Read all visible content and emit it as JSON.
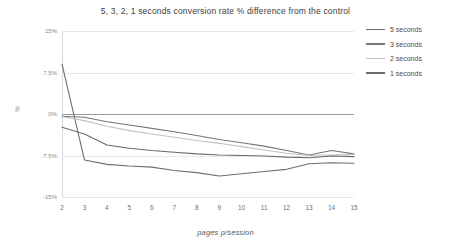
{
  "chart_data": {
    "type": "line",
    "title": "5, 3, 2, 1 seconds conversion rate % difference from the control",
    "xlabel": "pages p/session",
    "ylabel": "%",
    "x": [
      2,
      3,
      4,
      5,
      6,
      7,
      8,
      9,
      10,
      11,
      12,
      13,
      14,
      15
    ],
    "xticklabels": [
      "2",
      "3",
      "4",
      "5",
      "6",
      "7",
      "8",
      "9",
      "10",
      "11",
      "12",
      "13",
      "14",
      "15"
    ],
    "yticklabels": [
      "15%",
      "7.5%",
      "0%",
      "-7.5%",
      "-15%"
    ],
    "ytickvalues": [
      15,
      7.5,
      0,
      -7.5,
      -15
    ],
    "ylim": [
      -15,
      15
    ],
    "xlim": [
      2,
      15
    ],
    "grid": true,
    "zero_line": true,
    "legend_position": "top-right",
    "series": [
      {
        "name": "5 seconds",
        "color": "#6e6e6e",
        "values": [
          9.0,
          -8.3,
          -9.1,
          -9.4,
          -9.6,
          -10.2,
          -10.6,
          -11.2,
          -10.8,
          -10.4,
          -10.0,
          -9.0,
          -8.8,
          -8.9
        ]
      },
      {
        "name": "3 seconds",
        "color": "#777777",
        "values": [
          -0.4,
          -0.6,
          -1.4,
          -2.0,
          -2.6,
          -3.2,
          -3.9,
          -4.6,
          -5.2,
          -5.8,
          -6.6,
          -7.4,
          -6.6,
          -7.2
        ]
      },
      {
        "name": "2 seconds",
        "color": "#c2c2c2",
        "values": [
          -0.5,
          -1.2,
          -2.2,
          -3.0,
          -3.6,
          -4.2,
          -4.8,
          -5.3,
          -5.9,
          -6.5,
          -7.1,
          -7.5,
          -7.4,
          -7.3
        ]
      },
      {
        "name": "1 seconds",
        "color": "#6a6a6a",
        "values": [
          -2.4,
          -3.6,
          -5.6,
          -6.2,
          -6.6,
          -6.9,
          -7.2,
          -7.4,
          -7.5,
          -7.6,
          -7.8,
          -7.9,
          -7.6,
          -7.7
        ]
      }
    ]
  }
}
